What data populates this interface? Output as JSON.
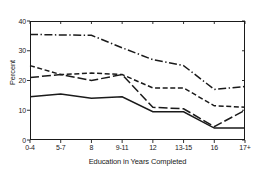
{
  "chart_data": {
    "type": "line",
    "title": "",
    "xlabel": "Education in Years Completed",
    "ylabel": "Percent",
    "categories": [
      "0-4",
      "5-7",
      "8",
      "9-11",
      "12",
      "13-15",
      "16",
      "17+"
    ],
    "ylim": [
      0,
      40
    ],
    "yticks": [
      0,
      10,
      20,
      30,
      40
    ],
    "grid": false,
    "legend": "none",
    "series": [
      {
        "name": "series-dash-dot",
        "style": "dash-dot",
        "values": [
          35.5,
          35.3,
          35.2,
          31.0,
          27.0,
          25.0,
          17.0,
          18.0
        ]
      },
      {
        "name": "series-dashed",
        "style": "dashed",
        "values": [
          25.0,
          22.0,
          22.5,
          22.0,
          17.5,
          17.5,
          11.5,
          11.0
        ]
      },
      {
        "name": "series-long-dash",
        "style": "long-dash",
        "values": [
          21.0,
          22.0,
          20.0,
          22.0,
          11.0,
          10.5,
          4.5,
          10.0
        ]
      },
      {
        "name": "series-solid",
        "style": "solid",
        "values": [
          14.5,
          15.5,
          14.0,
          14.5,
          9.5,
          9.5,
          4.0,
          4.0
        ]
      }
    ]
  },
  "axes": {
    "ytick_labels": [
      "0",
      "10",
      "20",
      "30",
      "40"
    ],
    "xtick_labels": [
      "0-4",
      "5-7",
      "8",
      "9-11",
      "12",
      "13-15",
      "16",
      "17+"
    ]
  },
  "colors": {
    "line": "#1a1a1a",
    "axis": "#1a1a1a",
    "background": "#ffffff"
  }
}
